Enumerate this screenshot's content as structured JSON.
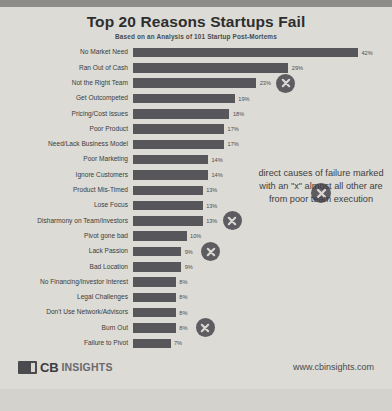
{
  "chart_data": {
    "type": "bar",
    "title": "Top 20 Reasons Startups Fail",
    "subtitle": "Based on an Analysis of 101 Startup Post-Mortems",
    "xlabel": "",
    "ylabel": "",
    "orientation": "horizontal",
    "xlim": [
      0,
      42
    ],
    "grid": false,
    "legend": null,
    "value_suffix": "%",
    "categories": [
      "No Market Need",
      "Ran Out of Cash",
      "Not the Right Team",
      "Get Outcompeted",
      "Pricing/Cost Issues",
      "Poor Product",
      "Need/Lack Business Model",
      "Poor Marketing",
      "Ignore Customers",
      "Product Mis-Timed",
      "Lose Focus",
      "Disharmony on Team/Investors",
      "Pivot gone bad",
      "Lack Passion",
      "Bad Location",
      "No Financing/Investor Interest",
      "Legal Challenges",
      "Don't Use Network/Advisors",
      "Burn Out",
      "Failure to Pivot"
    ],
    "values": [
      42,
      29,
      23,
      19,
      18,
      17,
      17,
      14,
      14,
      13,
      13,
      13,
      10,
      9,
      9,
      8,
      8,
      8,
      8,
      7
    ],
    "value_labels": [
      "42%",
      "29%",
      "23%",
      "19%",
      "18%",
      "17%",
      "17%",
      "14%",
      "14%",
      "13%",
      "13%",
      "13%",
      "10%",
      "9%",
      "9%",
      "8%",
      "8%",
      "8%",
      "8%",
      "7%"
    ],
    "marked_categories": [
      "Not the Right Team",
      "Disharmony on Team/Investors",
      "Lack Passion",
      "Burn Out"
    ],
    "marker_symbol": "x",
    "bar_color": "#57565b",
    "marker_color": "#5d5c61",
    "background_color": "#dcdbd6"
  },
  "annotation": {
    "text": "direct causes of failure marked with an \"x\" almost all other are from poor team execution"
  },
  "footer": {
    "brand_cb": "CB",
    "brand_insights": "INSIGHTS",
    "url": "www.cbinsights.com"
  }
}
